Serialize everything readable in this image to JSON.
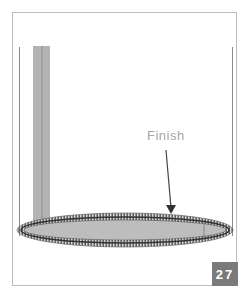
{
  "diagram": {
    "label": "Finish",
    "step_number": "27",
    "colors": {
      "frame": "#bdbdbd",
      "strap": "#b0b0b0",
      "ellipse_fill": "#bcbcbc",
      "ellipse_stitch": "#555555",
      "label": "#a6a6a6",
      "badge_bg": "#7a7a7a",
      "badge_text": "#ffffff",
      "arrow": "#444444"
    }
  }
}
